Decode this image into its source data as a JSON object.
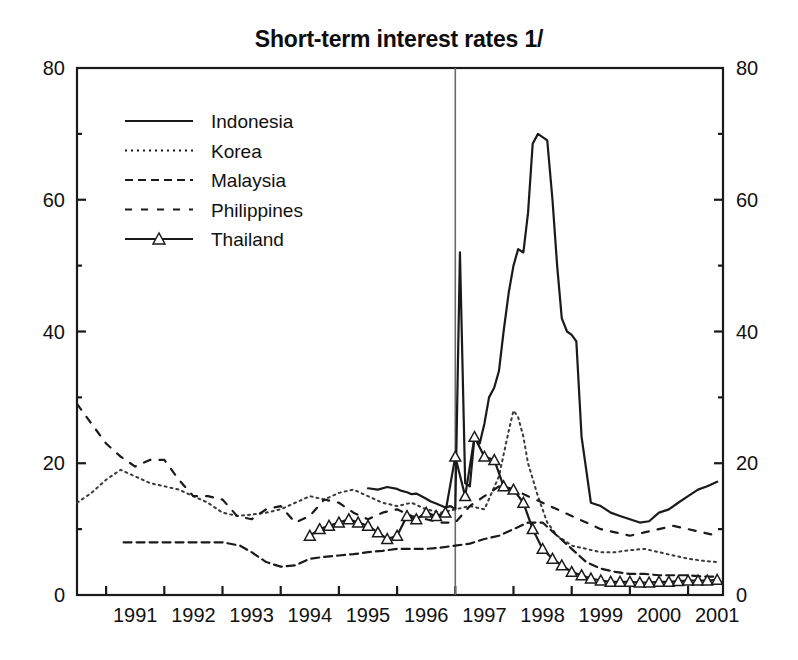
{
  "chart_data": {
    "type": "line",
    "title": "Short-term interest rates 1/",
    "xlabel": "",
    "ylabel": "",
    "xlim": [
      1990.5,
      2001.6
    ],
    "ylim": [
      0,
      80
    ],
    "yticks": [
      0,
      20,
      40,
      60,
      80
    ],
    "yticks_minor": [
      10,
      30,
      50,
      70
    ],
    "xticks": [
      1991,
      1992,
      1993,
      1994,
      1995,
      1996,
      1997,
      1998,
      1999,
      2000,
      2001
    ],
    "xtick_labels": [
      "1991",
      "1992",
      "1993",
      "1994",
      "1995",
      "1996",
      "1997",
      "1998",
      "1999",
      "2000",
      "2001"
    ],
    "grid": false,
    "dual_y_axis": true,
    "right_axis_ticks": [
      0,
      20,
      40,
      60,
      80
    ],
    "annotations": [
      {
        "type": "vline",
        "x": 1997.0,
        "label": "crisis-reference-line"
      }
    ],
    "legend_position": "upper-left",
    "series": [
      {
        "name": "Indonesia",
        "style": "solid",
        "marker": "none",
        "color": "#1a1a1a",
        "x": [
          1995.5,
          1995.67,
          1995.83,
          1996.0,
          1996.08,
          1996.17,
          1996.25,
          1996.33,
          1996.42,
          1996.5,
          1996.58,
          1996.67,
          1996.75,
          1996.83,
          1996.92,
          1997.0,
          1997.08,
          1997.17,
          1997.25,
          1997.33,
          1997.42,
          1997.5,
          1997.58,
          1997.67,
          1997.75,
          1997.83,
          1997.92,
          1998.0,
          1998.08,
          1998.17,
          1998.25,
          1998.33,
          1998.42,
          1998.5,
          1998.58,
          1998.67,
          1998.75,
          1998.83,
          1998.92,
          1999.0,
          1999.08,
          1999.17,
          1999.33,
          1999.5,
          1999.67,
          1999.83,
          2000.0,
          2000.17,
          2000.33,
          2000.5,
          2000.67,
          2000.83,
          2001.0,
          2001.17,
          2001.33,
          2001.5
        ],
        "y": [
          16.2,
          16.0,
          16.4,
          16.1,
          15.8,
          15.6,
          15.3,
          15.4,
          15.0,
          14.6,
          14.2,
          13.9,
          13.6,
          13.3,
          13.5,
          13.0,
          52.0,
          17.0,
          16.5,
          24.0,
          23.0,
          26.0,
          30.0,
          31.5,
          34.0,
          40.0,
          46.0,
          50.0,
          52.5,
          52.0,
          58.0,
          68.5,
          70.0,
          69.5,
          69.0,
          60.0,
          50.0,
          42.0,
          40.0,
          39.5,
          38.5,
          24.0,
          14.0,
          13.5,
          12.5,
          12.0,
          11.5,
          11.0,
          11.2,
          12.5,
          13.0,
          14.0,
          15.0,
          16.0,
          16.5,
          17.2
        ]
      },
      {
        "name": "Korea",
        "style": "dotted",
        "marker": "none",
        "color": "#3a3a3a",
        "x": [
          1990.5,
          1990.75,
          1991.0,
          1991.25,
          1991.5,
          1991.75,
          1992.0,
          1992.25,
          1992.5,
          1992.75,
          1993.0,
          1993.25,
          1993.5,
          1993.75,
          1994.0,
          1994.25,
          1994.5,
          1994.75,
          1995.0,
          1995.25,
          1995.5,
          1995.75,
          1996.0,
          1996.25,
          1996.5,
          1996.75,
          1997.0,
          1997.25,
          1997.5,
          1997.75,
          1997.92,
          1998.0,
          1998.08,
          1998.17,
          1998.25,
          1998.42,
          1998.58,
          1998.75,
          1998.92,
          1999.0,
          1999.25,
          1999.5,
          1999.75,
          2000.0,
          2000.25,
          2000.5,
          2000.75,
          2001.0,
          2001.25,
          2001.5
        ],
        "y": [
          14.0,
          15.5,
          17.5,
          19.0,
          18.0,
          17.0,
          16.5,
          16.0,
          15.0,
          14.0,
          12.5,
          12.0,
          12.2,
          12.5,
          13.0,
          14.0,
          15.0,
          14.5,
          15.5,
          16.0,
          15.0,
          14.0,
          13.5,
          14.0,
          13.0,
          12.5,
          13.0,
          13.5,
          13.0,
          18.0,
          25.0,
          28.0,
          27.0,
          24.0,
          20.0,
          15.0,
          11.0,
          9.0,
          8.0,
          7.5,
          7.0,
          6.5,
          6.5,
          6.8,
          7.0,
          6.5,
          6.0,
          5.5,
          5.2,
          5.0
        ]
      },
      {
        "name": "Malaysia",
        "style": "dashed-short",
        "marker": "none",
        "color": "#1a1a1a",
        "x": [
          1991.3,
          1991.5,
          1992.0,
          1992.5,
          1993.0,
          1993.3,
          1993.5,
          1993.75,
          1994.0,
          1994.25,
          1994.5,
          1994.75,
          1995.0,
          1995.25,
          1995.5,
          1995.75,
          1996.0,
          1996.25,
          1996.5,
          1996.75,
          1997.0,
          1997.25,
          1997.5,
          1997.75,
          1998.0,
          1998.25,
          1998.5,
          1998.75,
          1999.0,
          1999.25,
          1999.5,
          1999.75,
          2000.0,
          2000.25,
          2000.5,
          2000.75,
          2001.0,
          2001.25,
          2001.5
        ],
        "y": [
          8.0,
          8.0,
          8.0,
          8.0,
          8.0,
          7.5,
          6.5,
          5.0,
          4.3,
          4.5,
          5.5,
          5.8,
          6.0,
          6.2,
          6.5,
          6.7,
          7.0,
          7.0,
          7.0,
          7.2,
          7.5,
          7.8,
          8.5,
          9.0,
          10.0,
          11.0,
          11.0,
          9.0,
          7.0,
          5.0,
          4.0,
          3.5,
          3.2,
          3.2,
          3.0,
          3.0,
          3.0,
          2.8,
          2.8
        ]
      },
      {
        "name": "Philippines",
        "style": "dashed-long",
        "marker": "none",
        "color": "#1a1a1a",
        "x": [
          1990.5,
          1990.75,
          1991.0,
          1991.25,
          1991.5,
          1991.75,
          1992.0,
          1992.25,
          1992.5,
          1992.75,
          1993.0,
          1993.25,
          1993.5,
          1993.75,
          1994.0,
          1994.25,
          1994.5,
          1994.75,
          1995.0,
          1995.25,
          1995.5,
          1995.75,
          1996.0,
          1996.25,
          1996.5,
          1996.75,
          1997.0,
          1997.25,
          1997.5,
          1997.75,
          1998.0,
          1998.25,
          1998.5,
          1998.75,
          1999.0,
          1999.25,
          1999.5,
          1999.75,
          2000.0,
          2000.25,
          2000.5,
          2000.75,
          2001.0,
          2001.25,
          2001.5
        ],
        "y": [
          29.0,
          26.0,
          23.0,
          21.0,
          19.5,
          20.5,
          20.5,
          17.5,
          15.0,
          15.0,
          14.5,
          12.0,
          11.5,
          13.0,
          13.5,
          11.0,
          12.0,
          14.5,
          14.0,
          12.5,
          11.5,
          12.5,
          13.0,
          12.0,
          11.5,
          11.0,
          11.0,
          13.5,
          15.0,
          16.5,
          16.0,
          15.0,
          14.0,
          13.0,
          12.0,
          11.0,
          10.0,
          9.5,
          9.0,
          9.5,
          10.0,
          10.5,
          10.0,
          9.5,
          9.0
        ]
      },
      {
        "name": "Thailand",
        "style": "solid-marker",
        "marker": "triangle-up-open",
        "color": "#1a1a1a",
        "x": [
          1994.5,
          1994.67,
          1994.83,
          1995.0,
          1995.17,
          1995.33,
          1995.5,
          1995.67,
          1995.83,
          1996.0,
          1996.17,
          1996.33,
          1996.5,
          1996.67,
          1996.83,
          1997.0,
          1997.17,
          1997.33,
          1997.5,
          1997.67,
          1997.83,
          1998.0,
          1998.17,
          1998.33,
          1998.5,
          1998.67,
          1998.83,
          1999.0,
          1999.17,
          1999.33,
          1999.5,
          1999.67,
          1999.83,
          2000.0,
          2000.17,
          2000.33,
          2000.5,
          2000.67,
          2000.83,
          2001.0,
          2001.17,
          2001.33,
          2001.5
        ],
        "y": [
          9.0,
          10.0,
          10.5,
          11.0,
          11.5,
          11.0,
          10.5,
          9.5,
          8.5,
          9.0,
          12.0,
          11.5,
          12.5,
          12.0,
          12.5,
          21.0,
          15.0,
          24.0,
          21.0,
          20.5,
          16.5,
          16.0,
          14.0,
          10.0,
          7.0,
          5.5,
          4.5,
          3.5,
          3.0,
          2.5,
          2.2,
          2.0,
          2.0,
          2.0,
          1.9,
          1.9,
          2.0,
          2.0,
          2.1,
          2.2,
          2.2,
          2.2,
          2.3
        ]
      }
    ]
  },
  "legend": {
    "items": [
      {
        "label": "Indonesia",
        "style": "solid"
      },
      {
        "label": "Korea",
        "style": "dotted"
      },
      {
        "label": "Malaysia",
        "style": "dashed-short"
      },
      {
        "label": "Philippines",
        "style": "dashed-long"
      },
      {
        "label": "Thailand",
        "style": "solid-marker"
      }
    ]
  },
  "axes": {
    "left_labels": [
      "80",
      "60",
      "40",
      "20",
      "0"
    ],
    "right_labels": [
      "80",
      "60",
      "40",
      "20",
      "0"
    ],
    "x_labels": [
      "1991",
      "1992",
      "1993",
      "1994",
      "1995",
      "1996",
      "1997",
      "1998",
      "1999",
      "2000",
      "2001"
    ]
  },
  "colors": {
    "line": "#1a1a1a",
    "axis": "#1a1a1a",
    "reference_line": "#6b6b6b",
    "background": "#ffffff"
  }
}
